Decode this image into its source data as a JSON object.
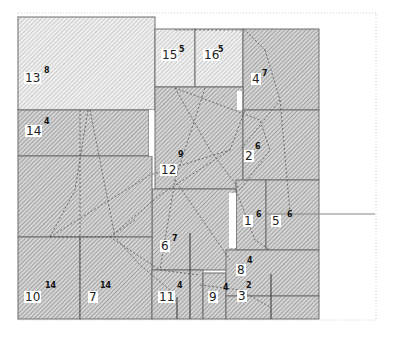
{
  "diagram": {
    "type": "block-layout-floorplan",
    "colors": {
      "block_fill": "#c8c8c8",
      "hatch_dense": "#9a9a9a",
      "hatch_light": "#b5b5b5",
      "border": "#6e6e6e",
      "dashed_link": "#555555",
      "frame_dotted": "#d0d0d0",
      "gap": "#ffffff"
    },
    "blocks": [
      {
        "id": "13",
        "label": "13",
        "weight": "8",
        "x": 18,
        "y": 17,
        "w": 137,
        "h": 93,
        "style": "light"
      },
      {
        "id": "15",
        "label": "15",
        "weight": "5",
        "x": 155,
        "y": 29,
        "w": 40,
        "h": 58,
        "style": "light"
      },
      {
        "id": "16",
        "label": "16",
        "weight": "5",
        "x": 195,
        "y": 29,
        "w": 48,
        "h": 58,
        "style": "light"
      },
      {
        "id": "4",
        "label": "4",
        "weight": "7",
        "x": 243,
        "y": 29,
        "w": 76,
        "h": 81,
        "style": "dense"
      },
      {
        "id": "14",
        "label": "14",
        "weight": "4",
        "x": 18,
        "y": 110,
        "w": 131,
        "h": 46,
        "style": "dense"
      },
      {
        "id": "12",
        "label": "12",
        "weight": "9",
        "x": 155,
        "y": 87,
        "w": 88,
        "h": 102,
        "style": "dense"
      },
      {
        "id": "2",
        "label": "2",
        "weight": "6",
        "x": 243,
        "y": 110,
        "w": 76,
        "h": 70,
        "style": "dense"
      },
      {
        "id": "1",
        "label": "1",
        "weight": "6",
        "x": 236,
        "y": 180,
        "w": 30,
        "h": 70,
        "style": "dense"
      },
      {
        "id": "5",
        "label": "5",
        "weight": "6",
        "x": 266,
        "y": 180,
        "w": 53,
        "h": 70,
        "style": "dense"
      },
      {
        "id": "6",
        "label": "6",
        "weight": "7",
        "x": 152,
        "y": 189,
        "w": 84,
        "h": 81,
        "style": "dense"
      },
      {
        "id": "big-left",
        "label": "",
        "weight": "",
        "x": 18,
        "y": 156,
        "w": 134,
        "h": 81,
        "style": "dense"
      },
      {
        "id": "10",
        "label": "10",
        "weight": "14",
        "x": 18,
        "y": 237,
        "w": 62,
        "h": 82,
        "style": "dense"
      },
      {
        "id": "7",
        "label": "7",
        "weight": "14",
        "x": 80,
        "y": 237,
        "w": 72,
        "h": 82,
        "style": "dense"
      },
      {
        "id": "11",
        "label": "11",
        "weight": "4",
        "x": 152,
        "y": 270,
        "w": 51,
        "h": 49,
        "style": "dense"
      },
      {
        "id": "9",
        "label": "9",
        "weight": "4",
        "x": 203,
        "y": 273,
        "w": 23,
        "h": 46,
        "style": "dense"
      },
      {
        "id": "8",
        "label": "8",
        "weight": "4",
        "x": 226,
        "y": 250,
        "w": 93,
        "h": 46,
        "style": "dense"
      },
      {
        "id": "3",
        "label": "3",
        "weight": "2",
        "x": 226,
        "y": 296,
        "w": 93,
        "h": 23,
        "style": "dense"
      }
    ],
    "labels": [
      {
        "text": "13",
        "sup": "8",
        "x": 24,
        "y": 72,
        "sx": 44,
        "sy": 67
      },
      {
        "text": "15",
        "sup": "5",
        "x": 161,
        "y": 49,
        "sx": 179,
        "sy": 46
      },
      {
        "text": "16",
        "sup": "5",
        "x": 203,
        "y": 49,
        "sx": 218,
        "sy": 46
      },
      {
        "text": "4",
        "sup": "7",
        "x": 251,
        "y": 73,
        "sx": 262,
        "sy": 70
      },
      {
        "text": "14",
        "sup": "4",
        "x": 25,
        "y": 125,
        "sx": 44,
        "sy": 118
      },
      {
        "text": "12",
        "sup": "9",
        "x": 160,
        "y": 164,
        "sx": 178,
        "sy": 151
      },
      {
        "text": "2",
        "sup": "6",
        "x": 244,
        "y": 150,
        "sx": 255,
        "sy": 143
      },
      {
        "text": "1",
        "sup": "6",
        "x": 243,
        "y": 215,
        "sx": 256,
        "sy": 211
      },
      {
        "text": "5",
        "sup": "6",
        "x": 271,
        "y": 215,
        "sx": 287,
        "sy": 211
      },
      {
        "text": "6",
        "sup": "7",
        "x": 160,
        "y": 240,
        "sx": 172,
        "sy": 235
      },
      {
        "text": "10",
        "sup": "14",
        "x": 24,
        "y": 291,
        "sx": 45,
        "sy": 282
      },
      {
        "text": "7",
        "sup": "14",
        "x": 88,
        "y": 291,
        "sx": 100,
        "sy": 282
      },
      {
        "text": "11",
        "sup": "4",
        "x": 158,
        "y": 291,
        "sx": 177,
        "sy": 282
      },
      {
        "text": "9",
        "sup": "4",
        "x": 208,
        "y": 291,
        "sx": 223,
        "sy": 284
      },
      {
        "text": "8",
        "sup": "4",
        "x": 236,
        "y": 264,
        "sx": 247,
        "sy": 257
      },
      {
        "text": "3",
        "sup": "2",
        "x": 237,
        "y": 290,
        "sx": 246,
        "sy": 282
      }
    ],
    "external_line": {
      "x1": 266,
      "y1": 214,
      "x2": 375,
      "y2": 214
    }
  }
}
